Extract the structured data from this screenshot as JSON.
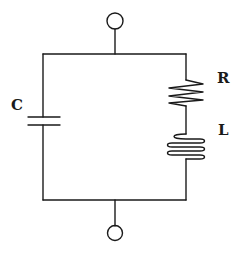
{
  "diagram": {
    "type": "circuit",
    "components": [
      {
        "id": "C",
        "label": "C",
        "kind": "capacitor",
        "branch": "left"
      },
      {
        "id": "R",
        "label": "R",
        "kind": "resistor",
        "branch": "right"
      },
      {
        "id": "L",
        "label": "L",
        "kind": "inductor",
        "branch": "right"
      }
    ],
    "terminals": [
      {
        "id": "top",
        "position": "top"
      },
      {
        "id": "bottom",
        "position": "bottom"
      }
    ],
    "colors": {
      "stroke": "#1a1a1a",
      "background": "#ffffff"
    }
  }
}
